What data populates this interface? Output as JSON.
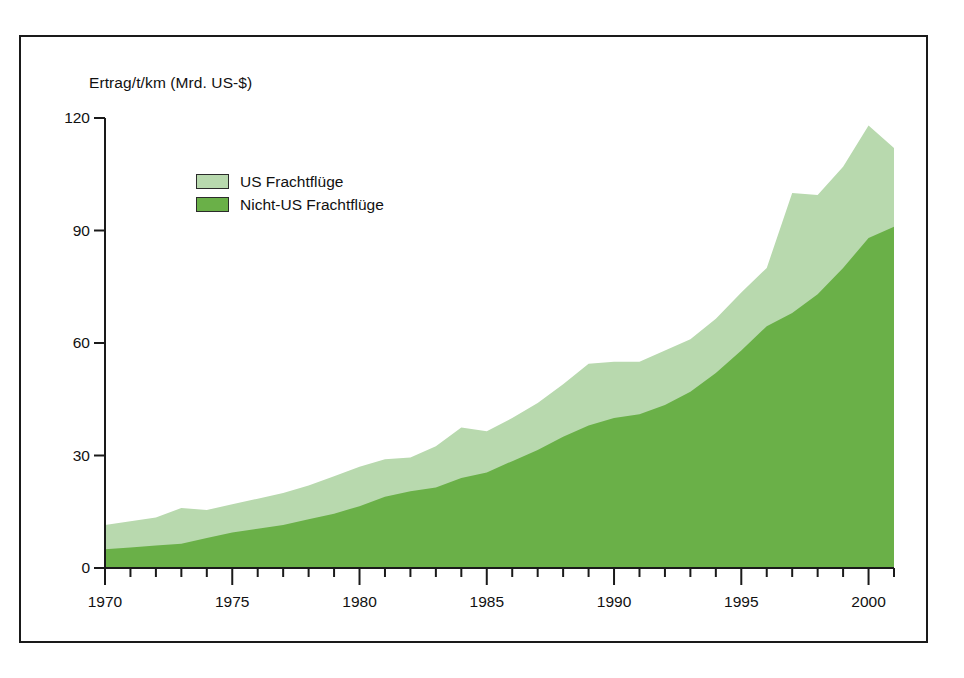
{
  "chart_data": {
    "type": "area",
    "stacked": true,
    "title": "",
    "subtitle": "",
    "xlabel": "",
    "ylabel": "Ertrag/t/km (Mrd. US-$)",
    "ylim": [
      0,
      120
    ],
    "xlim": [
      1970,
      2001
    ],
    "y_ticks": [
      0,
      30,
      60,
      90,
      120
    ],
    "x_ticks": [
      1970,
      1975,
      1980,
      1985,
      1990,
      1995,
      2000
    ],
    "x_minor_tick_interval": 1,
    "grid": false,
    "legend_position": "upper-left-inside",
    "x": [
      1970,
      1971,
      1972,
      1973,
      1974,
      1975,
      1976,
      1977,
      1978,
      1979,
      1980,
      1981,
      1982,
      1983,
      1984,
      1985,
      1986,
      1987,
      1988,
      1989,
      1990,
      1991,
      1992,
      1993,
      1994,
      1995,
      1996,
      1997,
      1998,
      1999,
      2000,
      2001
    ],
    "series": [
      {
        "name": "Nicht-US Frachtflüge",
        "color": "#6ab048",
        "values": [
          5,
          5.5,
          6,
          6.5,
          8,
          9.5,
          10.5,
          11.5,
          13,
          14.5,
          16.5,
          19,
          20.5,
          21.5,
          24,
          25.5,
          28.5,
          31.5,
          35,
          38,
          40,
          41,
          43.5,
          47,
          52,
          58,
          64.5,
          68,
          73,
          80,
          88,
          91
        ]
      },
      {
        "name": "US Frachtflüge",
        "color": "#b8d9ae",
        "values": [
          6.5,
          7,
          7.5,
          9.5,
          7.5,
          7.5,
          8,
          8.5,
          9,
          10,
          10.5,
          10,
          9,
          11,
          13.5,
          11,
          11.5,
          12.5,
          14,
          16.5,
          15,
          14,
          14.5,
          14,
          14.5,
          15.5,
          15.5,
          32,
          26.5,
          27,
          30,
          21
        ]
      }
    ],
    "totals": [
      11.5,
      12.5,
      13.5,
      16,
      15.5,
      17,
      18.5,
      20,
      22,
      24.5,
      27,
      29,
      29.5,
      32.5,
      37.5,
      36.5,
      40,
      44,
      49,
      54.5,
      55,
      55,
      58,
      61,
      66.5,
      73.5,
      80,
      100,
      99.5,
      107,
      118,
      112
    ]
  },
  "legend": {
    "items": [
      {
        "label": "US Frachtflüge",
        "color": "#b8d9ae"
      },
      {
        "label": "Nicht-US Frachtflüge",
        "color": "#6ab048"
      }
    ]
  },
  "axis": {
    "y_title": "Ertrag/t/km (Mrd. US-$)",
    "y_labels": [
      "120",
      "90",
      "60",
      "30",
      "0"
    ],
    "x_labels": [
      "1970",
      "1975",
      "1980",
      "1985",
      "1990",
      "1995",
      "2000"
    ]
  },
  "colors": {
    "light_green": "#b8d9ae",
    "dark_green": "#6ab048",
    "axis": "#1a1a1a",
    "frame": "#1a1a1a",
    "background": "#ffffff"
  }
}
